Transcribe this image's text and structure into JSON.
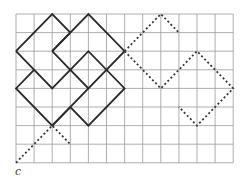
{
  "figure": {
    "label": "c",
    "grid": {
      "cols": 12,
      "rows": 8,
      "origin_x": 16,
      "origin_y": 14,
      "cell_w": 18.1,
      "cell_h": 18.6,
      "line_color": "#9a9a9a",
      "line_width": 0.8
    },
    "solid_style": {
      "color": "#2a2a2a",
      "width": 1.8
    },
    "dashed_style": {
      "color": "#3a3a3a",
      "width": 1.8,
      "dash": "2,2.4"
    },
    "solid_paths": [
      [
        [
          0,
          2
        ],
        [
          2,
          0
        ],
        [
          3,
          1
        ]
      ],
      [
        [
          2,
          2
        ],
        [
          4,
          0
        ],
        [
          6,
          2
        ],
        [
          4,
          4
        ],
        [
          3,
          3
        ],
        [
          2,
          4
        ],
        [
          0,
          2
        ]
      ],
      [
        [
          2,
          2
        ],
        [
          3,
          3
        ]
      ],
      [
        [
          1,
          3
        ],
        [
          0,
          4
        ],
        [
          2,
          6
        ],
        [
          4,
          4
        ]
      ],
      [
        [
          2,
          6
        ],
        [
          3,
          5
        ],
        [
          4,
          6
        ],
        [
          6,
          4
        ],
        [
          4,
          2
        ],
        [
          3,
          3
        ]
      ],
      [
        [
          3,
          1
        ],
        [
          2,
          2
        ]
      ]
    ],
    "dashed_paths": [
      [
        [
          0,
          8
        ],
        [
          2,
          6
        ],
        [
          3,
          7
        ]
      ],
      [
        [
          6,
          2
        ],
        [
          8,
          0
        ],
        [
          9,
          1
        ]
      ],
      [
        [
          6,
          2
        ],
        [
          8,
          4
        ],
        [
          10,
          2
        ],
        [
          12,
          4
        ],
        [
          10,
          6
        ],
        [
          9,
          5
        ]
      ]
    ]
  }
}
